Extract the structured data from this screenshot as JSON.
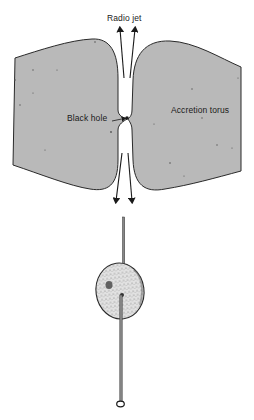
{
  "figure": {
    "labels": {
      "radio_jet": "Radio jet",
      "black_hole": "Black hole",
      "accretion_torus": "Accretion torus"
    },
    "colors": {
      "torus_fill": "#b9b9b9",
      "outline": "#2a2a2a",
      "background": "#ffffff",
      "sphere_fill": "#d8d8d8"
    },
    "components": [
      "accretion-torus-left-lobe",
      "accretion-torus-right-lobe",
      "black-hole",
      "radio-jet-upper",
      "radio-jet-lower",
      "pin-and-sphere-model"
    ]
  }
}
